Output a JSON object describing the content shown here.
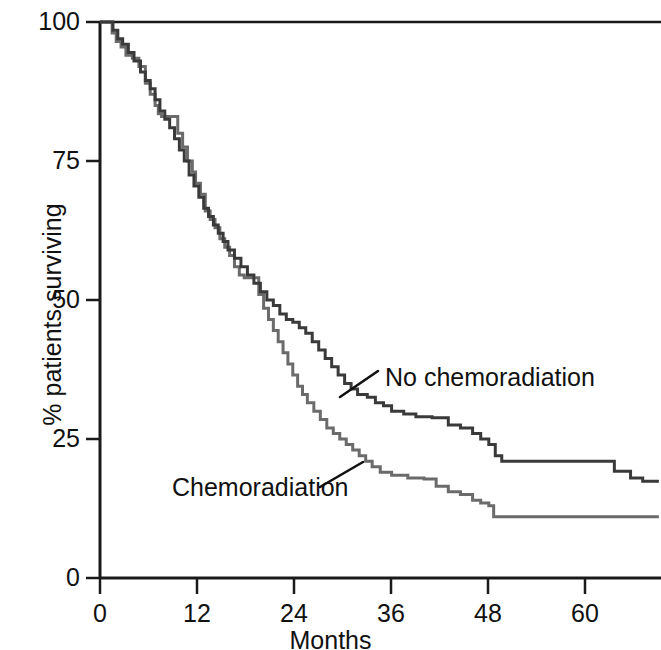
{
  "figure": {
    "background": "#ffffff",
    "axis_color": "#1a1a1a",
    "title": ""
  },
  "axes": {
    "x": {
      "label": "Months",
      "ticks": [
        0,
        12,
        24,
        36,
        48,
        60
      ],
      "tick_labels": [
        "0",
        "12",
        "24",
        "36",
        "48",
        "60"
      ],
      "range": [
        0,
        69
      ]
    },
    "y": {
      "label": "% patients surviving",
      "ticks": [
        0,
        25,
        50,
        75,
        100
      ],
      "tick_labels": [
        "0",
        "25",
        "50",
        "75",
        "100"
      ],
      "range": [
        0,
        100
      ]
    }
  },
  "annotations": [
    {
      "name": "no-chemoradiation",
      "text": "No chemoradiation",
      "color": "#111111"
    },
    {
      "name": "chemoradiation",
      "text": "Chemoradiation",
      "color": "#111111"
    }
  ],
  "chart_data": {
    "type": "line",
    "title": "",
    "xlabel": "Months",
    "ylabel": "% patients surviving",
    "xlim": [
      0,
      69
    ],
    "ylim": [
      0,
      100
    ],
    "grid": false,
    "legend": "inline-annotations",
    "step": "post",
    "series": [
      {
        "name": "No chemoradiation",
        "color": "#3a3a3a",
        "points": [
          [
            0,
            100
          ],
          [
            1.2,
            100
          ],
          [
            1.6,
            98.5
          ],
          [
            2.2,
            97.0
          ],
          [
            2.8,
            96.0
          ],
          [
            3.5,
            94.5
          ],
          [
            4.2,
            93.0
          ],
          [
            5.0,
            91.0
          ],
          [
            5.6,
            89.5
          ],
          [
            6.2,
            88.0
          ],
          [
            6.8,
            86.0
          ],
          [
            7.4,
            84.0
          ],
          [
            8.0,
            82.5
          ],
          [
            8.6,
            81.0
          ],
          [
            9.2,
            79.0
          ],
          [
            9.8,
            77.0
          ],
          [
            10.4,
            75.0
          ],
          [
            11.0,
            72.5
          ],
          [
            11.6,
            70.5
          ],
          [
            12.2,
            68.5
          ],
          [
            12.8,
            66.5
          ],
          [
            13.4,
            65.0
          ],
          [
            14.0,
            63.5
          ],
          [
            14.6,
            62.0
          ],
          [
            15.2,
            60.5
          ],
          [
            15.8,
            59.0
          ],
          [
            16.6,
            57.5
          ],
          [
            17.4,
            56.0
          ],
          [
            18.2,
            54.5
          ],
          [
            19.0,
            53.0
          ],
          [
            19.8,
            51.5
          ],
          [
            20.6,
            50.0
          ],
          [
            21.4,
            49.0
          ],
          [
            22.2,
            47.5
          ],
          [
            23.0,
            46.5
          ],
          [
            23.8,
            46.0
          ],
          [
            24.6,
            45.0
          ],
          [
            25.4,
            44.0
          ],
          [
            26.2,
            42.5
          ],
          [
            27.0,
            41.0
          ],
          [
            27.8,
            39.5
          ],
          [
            28.6,
            38.0
          ],
          [
            29.4,
            36.5
          ],
          [
            30.2,
            35.0
          ],
          [
            31.0,
            34.0
          ],
          [
            31.8,
            33.0
          ],
          [
            33.0,
            32.5
          ],
          [
            34.0,
            31.5
          ],
          [
            35.0,
            31.0
          ],
          [
            36.0,
            30.0
          ],
          [
            37.5,
            29.5
          ],
          [
            39.0,
            29.0
          ],
          [
            41.0,
            28.8
          ],
          [
            43.0,
            27.5
          ],
          [
            44.5,
            27.0
          ],
          [
            46.0,
            26.0
          ],
          [
            47.0,
            25.0
          ],
          [
            48.0,
            24.0
          ],
          [
            48.8,
            22.0
          ],
          [
            49.6,
            21.0
          ],
          [
            52.0,
            21.0
          ],
          [
            58.0,
            21.0
          ],
          [
            62.0,
            21.0
          ],
          [
            63.5,
            19.2
          ],
          [
            65.5,
            18.0
          ],
          [
            67.0,
            17.4
          ],
          [
            69.0,
            17.4
          ]
        ]
      },
      {
        "name": "Chemoradiation",
        "color": "#6b6b6b",
        "points": [
          [
            0,
            100
          ],
          [
            0.8,
            100
          ],
          [
            1.5,
            98.0
          ],
          [
            2.0,
            96.5
          ],
          [
            2.6,
            95.5
          ],
          [
            3.2,
            94.0
          ],
          [
            4.0,
            93.5
          ],
          [
            4.8,
            92.0
          ],
          [
            5.6,
            89.0
          ],
          [
            6.2,
            87.0
          ],
          [
            6.8,
            85.0
          ],
          [
            7.2,
            83.5
          ],
          [
            7.6,
            83.0
          ],
          [
            9.0,
            83.0
          ],
          [
            9.6,
            80.0
          ],
          [
            10.2,
            77.5
          ],
          [
            10.8,
            75.0
          ],
          [
            11.4,
            73.0
          ],
          [
            11.8,
            71.0
          ],
          [
            12.4,
            69.0
          ],
          [
            13.0,
            66.0
          ],
          [
            13.6,
            64.5
          ],
          [
            14.2,
            63.0
          ],
          [
            14.8,
            61.0
          ],
          [
            15.4,
            59.5
          ],
          [
            16.0,
            58.0
          ],
          [
            16.6,
            56.0
          ],
          [
            17.2,
            54.5
          ],
          [
            17.8,
            54.0
          ],
          [
            19.0,
            54.0
          ],
          [
            19.6,
            51.0
          ],
          [
            20.2,
            48.5
          ],
          [
            20.8,
            46.5
          ],
          [
            21.4,
            44.5
          ],
          [
            22.0,
            42.5
          ],
          [
            22.6,
            40.5
          ],
          [
            23.2,
            38.5
          ],
          [
            23.8,
            36.5
          ],
          [
            24.4,
            34.5
          ],
          [
            25.0,
            33.0
          ],
          [
            25.6,
            31.5
          ],
          [
            26.4,
            30.0
          ],
          [
            27.2,
            28.5
          ],
          [
            28.0,
            27.0
          ],
          [
            28.8,
            26.0
          ],
          [
            29.6,
            25.0
          ],
          [
            30.4,
            24.0
          ],
          [
            31.2,
            23.0
          ],
          [
            32.0,
            22.0
          ],
          [
            32.8,
            21.0
          ],
          [
            33.6,
            20.0
          ],
          [
            34.6,
            19.0
          ],
          [
            36.0,
            18.5
          ],
          [
            38.0,
            18.0
          ],
          [
            40.0,
            17.8
          ],
          [
            41.5,
            16.5
          ],
          [
            43.0,
            15.5
          ],
          [
            44.5,
            15.0
          ],
          [
            46.0,
            14.0
          ],
          [
            47.0,
            13.5
          ],
          [
            48.0,
            13.0
          ],
          [
            48.6,
            11.0
          ],
          [
            52.0,
            11.0
          ],
          [
            58.0,
            11.0
          ],
          [
            64.0,
            11.0
          ],
          [
            69.0,
            11.0
          ]
        ]
      }
    ]
  },
  "geometry": {
    "x0_px": 100,
    "px_per_month": 8.1,
    "y0_px": 578,
    "y100_px": 22
  }
}
